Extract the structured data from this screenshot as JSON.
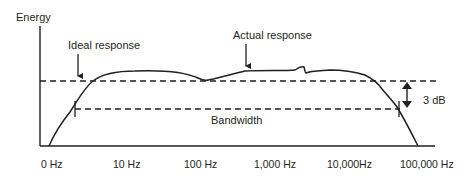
{
  "diagram": {
    "y_axis_label": "Energy",
    "annotations": {
      "ideal_response": "Ideal response",
      "actual_response": "Actual response",
      "bandwidth": "Bandwidth",
      "db_drop": "3 dB"
    },
    "x_ticks": [
      "0 Hz",
      "10 Hz",
      "100 Hz",
      "1,000 Hz",
      "10,000Hz",
      "100,000 Hz"
    ],
    "colors": {
      "line": "#231f20",
      "background": "#ffffff"
    }
  }
}
